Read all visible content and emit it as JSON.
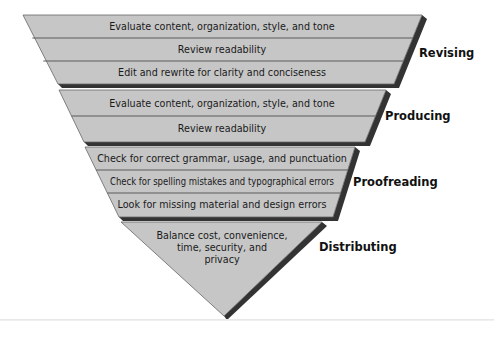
{
  "diagram": {
    "type": "inverted-funnel",
    "colors": {
      "fill": "#c6c6c6",
      "divider": "#5a5a5a",
      "outline": "#666666",
      "shadow": "#333333",
      "label": "#111111"
    },
    "stages": [
      {
        "label": "Revising",
        "rows": [
          "Evaluate content, organization, style, and tone",
          "Review readability",
          "Edit and rewrite for clarity and conciseness"
        ]
      },
      {
        "label": "Producing",
        "rows": [
          "Evaluate content, organization, style, and tone",
          "Review readability"
        ]
      },
      {
        "label": "Proofreading",
        "rows": [
          "Check for correct grammar, usage, and punctuation",
          "Check for spelling mistakes and typographical errors",
          "Look for missing material and design errors"
        ]
      },
      {
        "label": "Distributing",
        "rows": [
          "Balance cost, convenience,",
          "time, security, and",
          "privacy"
        ]
      }
    ]
  }
}
